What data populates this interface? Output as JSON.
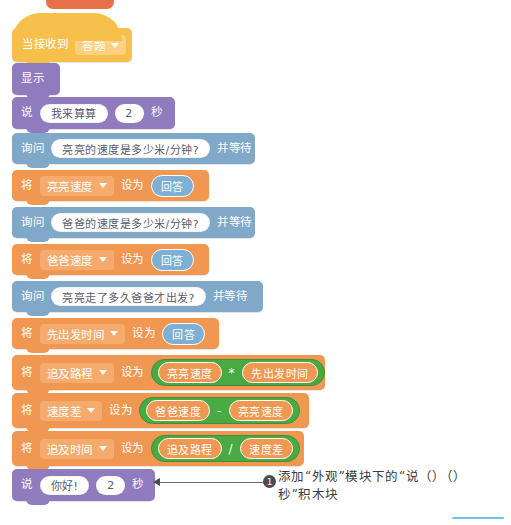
{
  "top_marker": {
    "name": "page-tab-marker",
    "color": "#e8714a"
  },
  "script": {
    "blocks": [
      {
        "id": "when-receive",
        "kind": "hat",
        "label": "当接收到",
        "dropdown": "答题"
      },
      {
        "id": "show",
        "kind": "looks",
        "label": "显示"
      },
      {
        "id": "say-1",
        "kind": "looks",
        "label": "说",
        "text": "我来算算",
        "seconds": "2",
        "unit": "秒"
      },
      {
        "id": "ask-1",
        "kind": "sensing",
        "label": "询问",
        "question": "亮亮的速度是多少米/分钟?",
        "tail": "并等待"
      },
      {
        "id": "set-1",
        "kind": "vars",
        "label": "将",
        "variable": "亮亮速度",
        "setto": "设为",
        "value": "回答"
      },
      {
        "id": "ask-2",
        "kind": "sensing",
        "label": "询问",
        "question": "爸爸的速度是多少米/分钟?",
        "tail": "并等待"
      },
      {
        "id": "set-2",
        "kind": "vars",
        "label": "将",
        "variable": "爸爸速度",
        "setto": "设为",
        "value": "回答"
      },
      {
        "id": "ask-3",
        "kind": "sensing",
        "label": "询问",
        "question": "亮亮走了多久爸爸才出发?",
        "tail": "并等待"
      },
      {
        "id": "set-3",
        "kind": "vars",
        "label": "将",
        "variable": "先出发时间",
        "setto": "设为",
        "value": "回答"
      },
      {
        "id": "set-4",
        "kind": "vars-op",
        "label": "将",
        "variable": "追及路程",
        "setto": "设为",
        "operand_left": "亮亮速度",
        "operator": "*",
        "operand_right": "先出发时间"
      },
      {
        "id": "set-5",
        "kind": "vars-op",
        "label": "将",
        "variable": "速度差",
        "setto": "设为",
        "operand_left": "爸爸速度",
        "operator": "-",
        "operand_right": "亮亮速度"
      },
      {
        "id": "set-6",
        "kind": "vars-op",
        "label": "将",
        "variable": "追及时间",
        "setto": "设为",
        "operand_left": "追及路程",
        "operator": "/",
        "operand_right": "速度差"
      },
      {
        "id": "say-2",
        "kind": "looks",
        "label": "说",
        "text": "你好!",
        "seconds": "2",
        "unit": "秒"
      }
    ]
  },
  "annotation": {
    "number": "1",
    "line1": "添加“外观”模块下的“说（）（）",
    "line2": "秒”积木块"
  },
  "colors": {
    "events": "#f7c04a",
    "looks": "#8f7bbd",
    "sensing": "#7fa8c9",
    "variables": "#f09752",
    "operators": "#49a942",
    "answer": "#7fb0d4",
    "accent_line": "#6ec3e8"
  }
}
